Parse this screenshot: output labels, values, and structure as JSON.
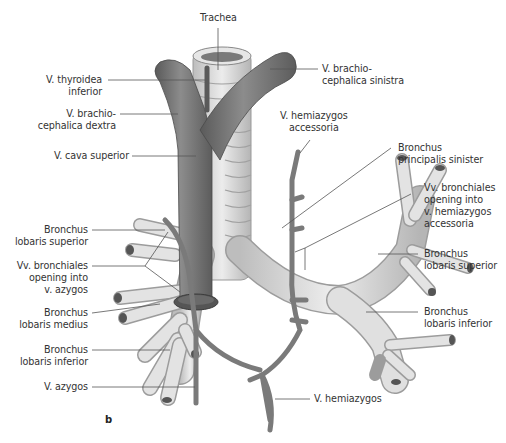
{
  "figure": {
    "panel_letter": "b",
    "colors": {
      "vein": "#7a7a7a",
      "vein_dark": "#4f4f4f",
      "bronchus": "#d9d9d9",
      "bronchus_ring": "#a9a9a9",
      "leader_line": "#555555",
      "text": "#333333"
    }
  },
  "labels": {
    "trachea": {
      "lines": [
        "Trachea"
      ]
    },
    "v_thyroidea_inferior": {
      "lines": [
        "V. thyroidea",
        "inferior"
      ]
    },
    "v_brachiocephalica_dextra": {
      "lines": [
        "V. brachio-",
        "cephalica dextra"
      ]
    },
    "v_cava_superior": {
      "lines": [
        "V. cava superior"
      ]
    },
    "v_brachiocephalica_sinistra": {
      "lines": [
        "V. brachio-",
        "cephalica sinistra"
      ]
    },
    "v_hemiazygos_accessoria": {
      "lines": [
        "V. hemiazygos",
        "accessoria"
      ]
    },
    "bronchus_principalis_sinister": {
      "lines": [
        "Bronchus",
        "principalis sinister"
      ]
    },
    "vv_bronchiales_hemiazygos": {
      "lines": [
        "Vv. bronchiales",
        "opening into",
        "v. hemiazygos",
        "accessoria"
      ]
    },
    "bronchus_lobaris_superior_right": {
      "lines": [
        "Bronchus",
        "lobaris superior"
      ]
    },
    "vv_bronchiales_azygos": {
      "lines": [
        "Vv. bronchiales",
        "opening into",
        "v. azygos"
      ]
    },
    "bronchus_lobaris_medius": {
      "lines": [
        "Bronchus",
        "lobaris medius"
      ]
    },
    "bronchus_lobaris_inferior_right": {
      "lines": [
        "Bronchus",
        "lobaris inferior"
      ]
    },
    "v_azygos": {
      "lines": [
        "V. azygos"
      ]
    },
    "bronchus_lobaris_superior_left": {
      "lines": [
        "Bronchus",
        "lobaris superior"
      ]
    },
    "bronchus_lobaris_inferior_left": {
      "lines": [
        "Bronchus",
        "lobaris inferior"
      ]
    },
    "v_hemiazygos": {
      "lines": [
        "V. hemiazygos"
      ]
    }
  }
}
